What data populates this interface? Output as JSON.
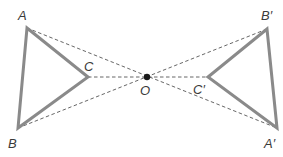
{
  "diagram": {
    "type": "geometry-enlargement",
    "colors": {
      "triangle_stroke": "#8a8a8a",
      "dashed_line": "#555555",
      "center_point": "#1a1a1a",
      "label": "#3a3a3a"
    },
    "center": {
      "id": "O",
      "label": "O",
      "x": 147,
      "y": 77,
      "label_x": 140,
      "label_y": 95
    },
    "triangle_original": {
      "name": "ABC",
      "vertices": [
        {
          "id": "A",
          "label": "A",
          "x": 27,
          "y": 28,
          "label_x": 18,
          "label_y": 20
        },
        {
          "id": "B",
          "label": "B",
          "x": 18,
          "y": 128,
          "label_x": 8,
          "label_y": 148
        },
        {
          "id": "C",
          "label": "C",
          "x": 88,
          "y": 77,
          "label_x": 84,
          "label_y": 71
        }
      ]
    },
    "triangle_image": {
      "name": "A'B'C'",
      "vertices": [
        {
          "id": "A'",
          "label": "A′",
          "x": 277,
          "y": 128,
          "label_x": 264,
          "label_y": 148
        },
        {
          "id": "B'",
          "label": "B′",
          "x": 267,
          "y": 29,
          "label_x": 261,
          "label_y": 20
        },
        {
          "id": "C'",
          "label": "C′",
          "x": 208,
          "y": 77,
          "label_x": 193,
          "label_y": 94
        }
      ]
    },
    "construction_lines": [
      {
        "from": "A",
        "to": "A'",
        "style": "dashed"
      },
      {
        "from": "B",
        "to": "B'",
        "style": "dashed"
      },
      {
        "from": "C",
        "to": "C'",
        "style": "dashed"
      }
    ]
  }
}
